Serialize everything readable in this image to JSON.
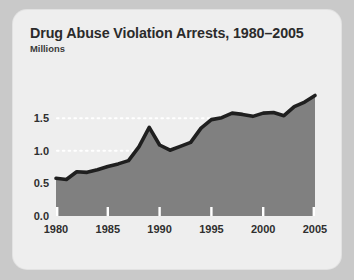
{
  "card": {
    "title": "Drug Abuse Violation Arrests, 1980–2005",
    "subtitle": "Millions"
  },
  "colors": {
    "page_background": "#c9c9c9",
    "card_background": "#eeeeee",
    "area_fill": "#808080",
    "line_stroke": "#1f1f1f",
    "gridline": "#ffffff",
    "tick": "#ffffff",
    "text": "#2b2b2b"
  },
  "chart_data": {
    "type": "area",
    "title": "Drug Abuse Violation Arrests, 1980–2005",
    "subtitle": "Millions",
    "xlabel": "",
    "ylabel": "Millions",
    "xlim": [
      1980,
      2005
    ],
    "ylim": [
      0.0,
      1.95
    ],
    "grid": true,
    "gridlines_y": [
      1.0,
      1.5
    ],
    "legend": "none",
    "ytick_labels": [
      "0.0",
      "0.5",
      "1.0",
      "1.5"
    ],
    "ytick_values": [
      0.0,
      0.5,
      1.0,
      1.5
    ],
    "xtick_labels": [
      "1980",
      "1985",
      "1990",
      "1995",
      "2000",
      "2005"
    ],
    "xtick_values": [
      1980,
      1985,
      1990,
      1995,
      2000,
      2005
    ],
    "x": [
      1980,
      1981,
      1982,
      1983,
      1984,
      1985,
      1986,
      1987,
      1988,
      1989,
      1990,
      1991,
      1992,
      1993,
      1994,
      1995,
      1996,
      1997,
      1998,
      1999,
      2000,
      2001,
      2002,
      2003,
      2004,
      2005
    ],
    "series": [
      {
        "name": "Drug abuse violation arrests",
        "values": [
          0.58,
          0.56,
          0.68,
          0.67,
          0.71,
          0.76,
          0.8,
          0.85,
          1.06,
          1.36,
          1.09,
          1.01,
          1.07,
          1.13,
          1.35,
          1.48,
          1.51,
          1.58,
          1.56,
          1.53,
          1.58,
          1.59,
          1.54,
          1.68,
          1.75,
          1.85
        ]
      }
    ]
  }
}
